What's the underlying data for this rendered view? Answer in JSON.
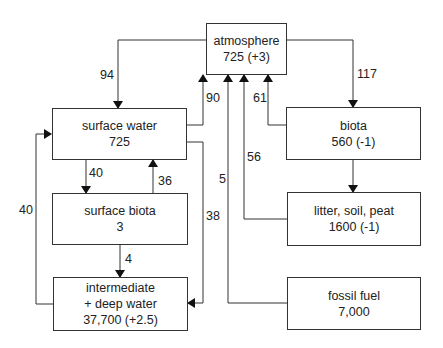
{
  "diagram": {
    "nodes": {
      "atmosphere": {
        "name": "atmosphere",
        "value": "725 (+3)"
      },
      "surface_water": {
        "name": "surface water",
        "value": "725"
      },
      "surface_biota": {
        "name": "surface biota",
        "value": "3"
      },
      "deep_water": {
        "name": "intermediate",
        "name2": "+ deep water",
        "value": "37,700 (+2.5)"
      },
      "biota": {
        "name": "biota",
        "value": "560 (-1)"
      },
      "litter": {
        "name": "litter, soil, peat",
        "value": "1600 (-1)"
      },
      "fossil_fuel": {
        "name": "fossil fuel",
        "value": "7,000"
      }
    },
    "flows": {
      "atm_to_surface_water": "94",
      "surface_water_to_atm": "90",
      "atm_to_biota": "117",
      "biota_to_atm": "61",
      "litter_to_atm": "56",
      "fossil_to_atm": "5",
      "surface_water_to_surface_biota": "40",
      "surface_biota_to_surface_water": "36",
      "surface_water_to_deep": "38",
      "surface_biota_to_deep": "4",
      "deep_to_surface_water": "40"
    }
  }
}
